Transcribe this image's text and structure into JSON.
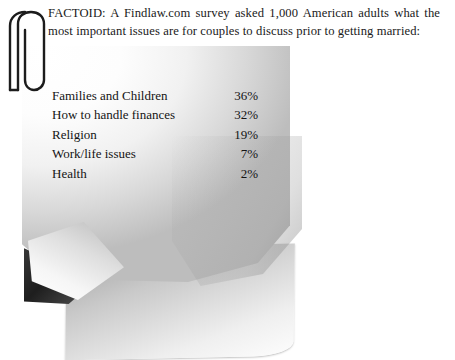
{
  "document": {
    "intro_text": "FACTOID: A Findlaw.com survey asked 1,000 American adults what the most important issues are for couples to discuss prior to getting married:",
    "items": [
      {
        "label": "Families and Children",
        "value": "36%"
      },
      {
        "label": "How to handle finances",
        "value": "32%"
      },
      {
        "label": "Religion",
        "value": "19%"
      },
      {
        "label": "Work/life issues",
        "value": "7%"
      },
      {
        "label": "Health",
        "value": "2%"
      }
    ],
    "icons": {
      "paperclip": "paperclip-icon"
    },
    "colors": {
      "background": "#ffffff",
      "text": "#1a1a1a",
      "paper_light": "#fdfdfd",
      "paper_shadow": "#bdbdbd",
      "crease_dark": "#1e1e1e"
    }
  }
}
